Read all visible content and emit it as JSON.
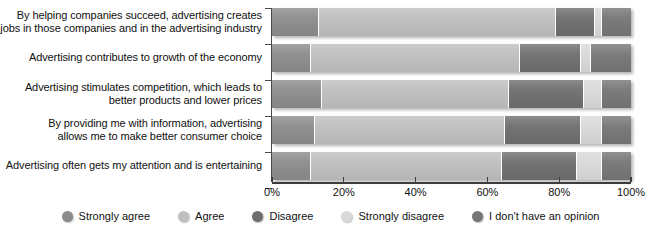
{
  "chart_data": {
    "type": "bar",
    "orientation": "horizontal",
    "stacked": true,
    "stack_mode": "percent",
    "title": "",
    "subtitle": "",
    "xlabel": "",
    "ylabel": "",
    "xlim": [
      0,
      100
    ],
    "grid": false,
    "legend_position": "bottom",
    "tick_labels": [
      "0%",
      "20%",
      "40%",
      "60%",
      "80%",
      "100%"
    ],
    "tick_values": [
      0,
      20,
      40,
      60,
      80,
      100
    ],
    "categories": [
      "By helping companies succeed, advertising creates jobs in those companies and in the advertising industry",
      "Advertising contributes to growth of the economy",
      "Advertising stimulates competition, which leads to better products and lower prices",
      "By providing me with information, advertising allows me to make better consumer choice",
      "Advertising often gets my attention and is entertaining"
    ],
    "category_lines": [
      [
        "By helping companies succeed, advertising creates",
        "jobs in those companies and in the advertising industry"
      ],
      [
        "Advertising contributes to growth of the economy"
      ],
      [
        "Advertising stimulates competition, which leads to",
        "better products and lower prices"
      ],
      [
        "By providing me with information, advertising",
        "allows me to make better consumer choice"
      ],
      [
        "Advertising often gets my attention and is entertaining"
      ]
    ],
    "series": [
      {
        "name": "Strongly agree",
        "color": "#8c8c8c",
        "values": [
          13,
          11,
          14,
          12,
          11
        ]
      },
      {
        "name": "Agree",
        "color": "#bfbfbf",
        "values": [
          66,
          58,
          52,
          53,
          53
        ]
      },
      {
        "name": "Disagree",
        "color": "#6e6e6e",
        "values": [
          11,
          17,
          21,
          21,
          21
        ]
      },
      {
        "name": "Strongly disagree",
        "color": "#d9d9d9",
        "values": [
          2,
          3,
          5,
          6,
          7
        ]
      },
      {
        "name": "I don't have an opinion",
        "color": "#767676",
        "values": [
          8,
          11,
          8,
          8,
          8
        ]
      }
    ]
  },
  "legend": {
    "items": [
      {
        "label": "Strongly agree",
        "color": "#8c8c8c"
      },
      {
        "label": "Agree",
        "color": "#bfbfbf"
      },
      {
        "label": "Disagree",
        "color": "#6e6e6e"
      },
      {
        "label": "Strongly disagree",
        "color": "#d9d9d9"
      },
      {
        "label": "I don't have an opinion",
        "color": "#767676"
      }
    ]
  },
  "colors": {
    "axis": "#3d3d3d",
    "background": "#ffffff",
    "text": "#101010"
  }
}
